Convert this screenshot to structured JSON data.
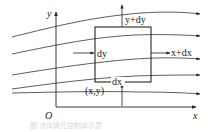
{
  "diagram": {
    "axes": {
      "x_label": "x",
      "y_label": "y",
      "origin_label": "O"
    },
    "element": {
      "corner_label": "(x,y)",
      "width_label": "dx",
      "height_label": "dy",
      "top_label": "y+dy",
      "right_label": "x+dx"
    },
    "streamlines_count": 5,
    "caption": "图 流体微元控制体示意",
    "colors": {
      "line": "#333333",
      "background": "#ffffff",
      "caption": "#d8d8d8"
    }
  }
}
